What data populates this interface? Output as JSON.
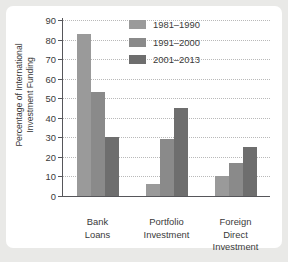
{
  "chart_data": {
    "type": "bar",
    "title": "",
    "xlabel": "",
    "ylabel": "Percentage of International Investment Funding",
    "ylabel_lines": [
      "Percentage of International",
      "Investment Funding"
    ],
    "categories": [
      "Bank\nLoans",
      "Portfolio\nInvestment",
      "Foreign\nDirect\nInvestment"
    ],
    "ylim": [
      0,
      90
    ],
    "yticks": [
      0,
      10,
      20,
      30,
      40,
      50,
      60,
      70,
      80,
      90
    ],
    "grid": true,
    "legend_position": "top-right",
    "series": [
      {
        "name": "1981–1990",
        "color": "#9a9a9a",
        "values": [
          83,
          6,
          10
        ]
      },
      {
        "name": "1991–2000",
        "color": "#8a8a8a",
        "values": [
          53,
          29,
          17
        ]
      },
      {
        "name": "2001–2013",
        "color": "#6e6e6e",
        "values": [
          30,
          45,
          25
        ]
      }
    ]
  },
  "style": {
    "page_background": "#e9e9e7",
    "card_background": "#ffffff",
    "axis_color": "#56565a",
    "grid_color": "#b9b9b9",
    "text_color": "#3a3a3a"
  }
}
